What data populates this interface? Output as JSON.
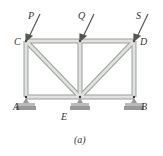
{
  "diagram": {
    "type": "truss",
    "caption": "(a)",
    "loads": [
      {
        "label": "P",
        "node": "C"
      },
      {
        "label": "Q",
        "node": "mid-top"
      },
      {
        "label": "S",
        "node": "D"
      }
    ],
    "nodes": [
      {
        "label": "C",
        "position": "top-left"
      },
      {
        "label": "D",
        "position": "top-right"
      },
      {
        "label": "A",
        "position": "bottom-left",
        "support": "rocker"
      },
      {
        "label": "E",
        "position": "bottom-middle",
        "support": "rocker"
      },
      {
        "label": "B",
        "position": "bottom-right",
        "support": "rocker"
      }
    ],
    "members": [
      "C-Q",
      "Q-D",
      "A-E",
      "E-B",
      "A-C",
      "Q-E",
      "B-D",
      "C-E",
      "D-E"
    ],
    "colors": {
      "member": "#d9dcd8",
      "member_edge": "#9a9e99",
      "arrow": "#555555",
      "support": "#999999"
    }
  }
}
